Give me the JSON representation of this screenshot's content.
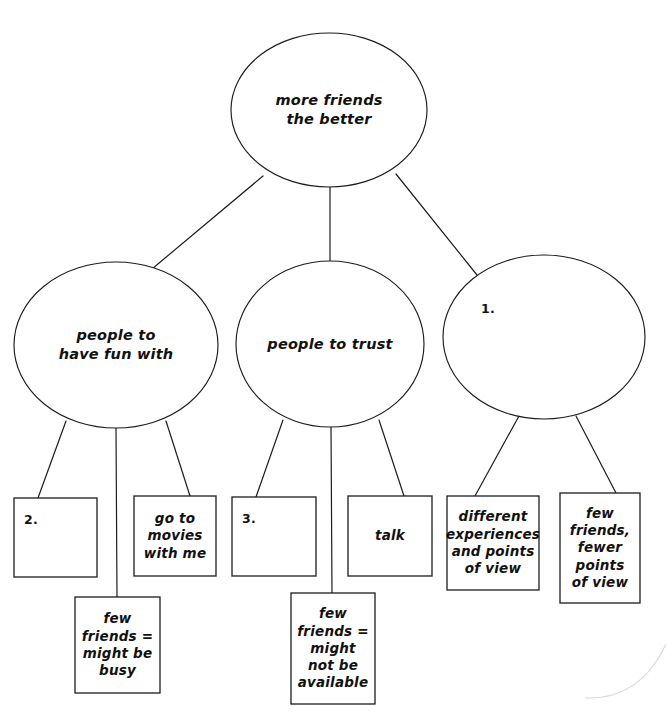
{
  "diagram": {
    "type": "concept-map",
    "title_text": "more friends the better",
    "canvas": {
      "width": 666,
      "height": 719,
      "background": "#ffffff"
    },
    "stroke_color": "#1c1c1c",
    "text_color": "#111111",
    "nodes": [
      {
        "id": "root",
        "shape": "ellipse",
        "label": "more friends\nthe better",
        "cx": 329,
        "cy": 110,
        "rx": 98,
        "ry": 77,
        "level": 0
      },
      {
        "id": "branch-fun",
        "shape": "ellipse",
        "label": "people to\nhave fun with",
        "cx": 116,
        "cy": 345,
        "rx": 102,
        "ry": 83,
        "level": 1
      },
      {
        "id": "branch-trust",
        "shape": "ellipse",
        "label": "people to trust",
        "cx": 330,
        "cy": 344,
        "rx": 94,
        "ry": 83,
        "level": 1
      },
      {
        "id": "branch-unlabeled",
        "shape": "ellipse",
        "label": "1.",
        "label_style": "numeral",
        "cx": 544,
        "cy": 337,
        "rx": 101,
        "ry": 82,
        "level": 1
      },
      {
        "id": "leaf-2",
        "shape": "rect",
        "label": "2.",
        "label_style": "numeral",
        "x": 14,
        "y": 498,
        "w": 83,
        "h": 79,
        "level": 2
      },
      {
        "id": "leaf-movies",
        "shape": "rect",
        "label": "go to\nmovies\nwith me",
        "x": 134,
        "y": 496,
        "w": 82,
        "h": 80,
        "level": 2
      },
      {
        "id": "leaf-3",
        "shape": "rect",
        "label": "3.",
        "label_style": "numeral",
        "x": 232,
        "y": 497,
        "w": 84,
        "h": 79,
        "level": 2
      },
      {
        "id": "leaf-talk",
        "shape": "rect",
        "label": "talk",
        "x": 348,
        "y": 496,
        "w": 84,
        "h": 80,
        "level": 2
      },
      {
        "id": "leaf-different-experiences",
        "shape": "rect",
        "label": "different\nexperiences\nand points\nof view",
        "x": 447,
        "y": 496,
        "w": 92,
        "h": 94,
        "level": 2
      },
      {
        "id": "leaf-fewer-points",
        "shape": "rect",
        "label": "few\nfriends,\nfewer\npoints\nof view",
        "x": 560,
        "y": 493,
        "w": 80,
        "h": 110,
        "level": 2
      },
      {
        "id": "leaf-busy",
        "shape": "rect",
        "label": "few\nfriends =\nmight be\nbusy",
        "x": 75,
        "y": 597,
        "w": 85,
        "h": 96,
        "level": 3
      },
      {
        "id": "leaf-not-available",
        "shape": "rect",
        "label": "few\nfriends =\nmight\nnot be\navailable",
        "x": 291,
        "y": 593,
        "w": 84,
        "h": 111,
        "level": 3
      }
    ],
    "edges": [
      {
        "id": "edge-root-fun",
        "from": "root",
        "to": "branch-fun",
        "x1": 263,
        "y1": 176,
        "x2": 146,
        "y2": 274
      },
      {
        "id": "edge-root-trust",
        "from": "root",
        "to": "branch-trust",
        "x1": 330,
        "y1": 187,
        "x2": 330,
        "y2": 261
      },
      {
        "id": "edge-root-unlabeled",
        "from": "root",
        "to": "branch-unlabeled",
        "x1": 396,
        "y1": 174,
        "x2": 477,
        "y2": 275
      },
      {
        "id": "edge-fun-2",
        "from": "branch-fun",
        "to": "leaf-2",
        "x1": 66,
        "y1": 421,
        "x2": 38,
        "y2": 498
      },
      {
        "id": "edge-fun-busy",
        "from": "branch-fun",
        "to": "leaf-busy",
        "x1": 116,
        "y1": 428,
        "x2": 117,
        "y2": 597
      },
      {
        "id": "edge-fun-movies",
        "from": "branch-fun",
        "to": "leaf-movies",
        "x1": 166,
        "y1": 421,
        "x2": 190,
        "y2": 496
      },
      {
        "id": "edge-trust-3",
        "from": "branch-trust",
        "to": "leaf-3",
        "x1": 283,
        "y1": 420,
        "x2": 256,
        "y2": 497
      },
      {
        "id": "edge-trust-notavail",
        "from": "branch-trust",
        "to": "leaf-not-available",
        "x1": 331,
        "y1": 427,
        "x2": 332,
        "y2": 593
      },
      {
        "id": "edge-trust-talk",
        "from": "branch-trust",
        "to": "leaf-talk",
        "x1": 379,
        "y1": 420,
        "x2": 404,
        "y2": 496
      },
      {
        "id": "edge-unlabeled-different",
        "from": "branch-unlabeled",
        "to": "leaf-different-experiences",
        "x1": 519,
        "y1": 416,
        "x2": 475,
        "y2": 496
      },
      {
        "id": "edge-unlabeled-fewer",
        "from": "branch-unlabeled",
        "to": "leaf-fewer-points",
        "x1": 576,
        "y1": 416,
        "x2": 616,
        "y2": 493
      }
    ],
    "artifacts": [
      {
        "id": "scan-arc",
        "d": "M 666 644 Q 640 700 585 698",
        "note": "faint scan edge arc"
      }
    ]
  }
}
